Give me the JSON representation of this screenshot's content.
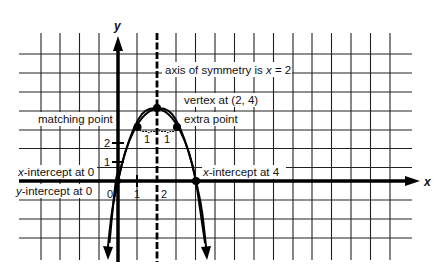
{
  "diagram": {
    "type": "parabola-graph",
    "equation_hint": "y = -x^2 + 4x",
    "axes": {
      "x_label": "x",
      "y_label": "y",
      "origin_label": "0",
      "x_ticks": [
        "1",
        "2"
      ],
      "y_ticks": [
        "1",
        "2"
      ]
    },
    "annotations": {
      "axis_of_symmetry": "axis of symmetry is x = 2",
      "axis_prefix": "axis of symmetry is ",
      "axis_var": "x",
      "axis_suffix": " = 2",
      "vertex": "vertex at (2, 4)",
      "matching_point": "matching point",
      "extra_point": "extra point",
      "x_intercept_0_var": "x",
      "x_intercept_0_rest": "-intercept at 0",
      "y_intercept_0_var": "y",
      "y_intercept_0_rest": "-intercept at 0",
      "x_intercept_4_var": "x",
      "x_intercept_4_rest": "-intercept at 4",
      "distance_left": "1",
      "distance_right": "1"
    },
    "points": [
      {
        "name": "origin",
        "x": 0,
        "y": 0
      },
      {
        "name": "matching point",
        "x": 1,
        "y": 3
      },
      {
        "name": "vertex",
        "x": 2,
        "y": 4
      },
      {
        "name": "extra point",
        "x": 3,
        "y": 3
      },
      {
        "name": "x-intercept",
        "x": 4,
        "y": 0
      }
    ],
    "grid": {
      "x_range": [
        -4,
        14
      ],
      "y_range": [
        -3,
        7
      ],
      "unit_px": 19.4
    },
    "colors": {
      "ink": "#111111",
      "background": "#ffffff"
    }
  }
}
